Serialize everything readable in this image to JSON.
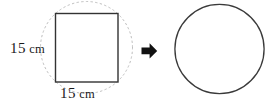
{
  "figure": {
    "background_color": "#ffffff",
    "width": 277,
    "height": 106
  },
  "shapes": {
    "square": {
      "name": "square",
      "x": 55,
      "y": 13,
      "width": 63,
      "height": 69,
      "stroke_color": "#333333",
      "stroke_width": 1.4,
      "fill": "none"
    },
    "circumscribed_circle": {
      "name": "dotted-circumscribed-circle",
      "cx": 86.5,
      "cy": 47.5,
      "r": 46,
      "stroke_color": "#b9b9b9",
      "stroke_width": 1,
      "dash": "1.5 3",
      "fill": "none"
    },
    "result_circle": {
      "name": "result-circle",
      "cx": 219.5,
      "cy": 49,
      "r": 45,
      "stroke_color": "#3a3a3a",
      "stroke_width": 1.3,
      "fill": "none"
    },
    "arrow": {
      "name": "right-arrow",
      "color": "#111111",
      "x": 141,
      "y": 43,
      "width": 16,
      "height": 16
    }
  },
  "labels": {
    "height": {
      "number": "15",
      "unit": "cm",
      "full": "15 cm"
    },
    "width": {
      "number": "15",
      "unit": "cm",
      "full": "15 cm"
    }
  }
}
